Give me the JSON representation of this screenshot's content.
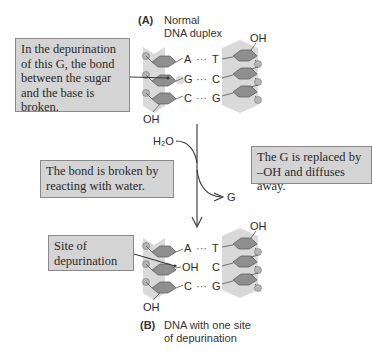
{
  "figure": {
    "panel_a": {
      "letter": "(A)",
      "caption": "Normal\nDNA duplex",
      "pairs": [
        {
          "left": "A",
          "dots": "···",
          "right": "T"
        },
        {
          "left": "G",
          "dots": "···",
          "right": "C"
        },
        {
          "left": "C",
          "dots": "···",
          "right": "G"
        }
      ],
      "left_end": "OH",
      "right_end": "OH"
    },
    "panel_b": {
      "letter": "(B)",
      "caption": "DNA with one site\nof depurination",
      "pairs": [
        {
          "left": "A",
          "dots": "···",
          "right": "T"
        },
        {
          "left": "OH",
          "dots": "",
          "right": "C"
        },
        {
          "left": "C",
          "dots": "···",
          "right": "G"
        }
      ],
      "left_end": "OH",
      "right_end": "OH"
    },
    "callouts": {
      "depurination_bond": "In the depurination\nof this G, the bond\nbetween the sugar\nand the base is\nbroken.",
      "water_reaction": "The bond is broken by\nreacting with water.",
      "g_replaced": "The G is replaced by\n–OH and diffuses away.",
      "site": "Site of\ndepurination"
    },
    "reaction": {
      "reactant": "H₂O",
      "product": "G"
    },
    "colors": {
      "backbone": "#d9d9d9",
      "sugar": "#8f8f8f",
      "phosphate": "#b5b5b5",
      "callout_bg": "#d4d4d4",
      "callout_border": "#8a8a8a",
      "line": "#3a3a3a"
    }
  }
}
